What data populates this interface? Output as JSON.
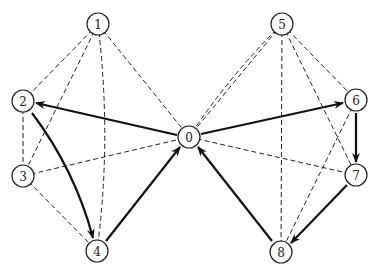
{
  "diagram": {
    "type": "directed-graph",
    "nodes": [
      {
        "id": "0",
        "label": "0",
        "x": 189,
        "y": 137
      },
      {
        "id": "1",
        "label": "1",
        "x": 98,
        "y": 24
      },
      {
        "id": "2",
        "label": "2",
        "x": 23,
        "y": 101
      },
      {
        "id": "3",
        "label": "3",
        "x": 23,
        "y": 176
      },
      {
        "id": "4",
        "label": "4",
        "x": 97,
        "y": 251
      },
      {
        "id": "5",
        "label": "5",
        "x": 282,
        "y": 24
      },
      {
        "id": "6",
        "label": "6",
        "x": 356,
        "y": 100
      },
      {
        "id": "7",
        "label": "7",
        "x": 356,
        "y": 175
      },
      {
        "id": "8",
        "label": "8",
        "x": 281,
        "y": 252
      }
    ],
    "dashed_edges": [
      [
        "1",
        "2"
      ],
      [
        "1",
        "3"
      ],
      [
        "1",
        "4"
      ],
      [
        "1",
        "0"
      ],
      [
        "2",
        "3"
      ],
      [
        "3",
        "4"
      ],
      [
        "3",
        "0"
      ],
      [
        "5",
        "0"
      ],
      [
        "5",
        "0"
      ],
      [
        "5",
        "6"
      ],
      [
        "5",
        "7"
      ],
      [
        "5",
        "8"
      ],
      [
        "6",
        "8"
      ],
      [
        "0",
        "7"
      ]
    ],
    "directed_edges": [
      [
        "0",
        "2"
      ],
      [
        "2",
        "4"
      ],
      [
        "4",
        "0"
      ],
      [
        "0",
        "6"
      ],
      [
        "6",
        "7"
      ],
      [
        "7",
        "8"
      ],
      [
        "8",
        "0"
      ]
    ]
  }
}
